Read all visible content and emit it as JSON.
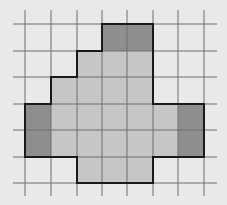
{
  "grid": {
    "x_lines": [
      25,
      51,
      77,
      102,
      127,
      153,
      178,
      204
    ],
    "y_lines": [
      24,
      51,
      77,
      104,
      130,
      157,
      183
    ],
    "h_line_extent": [
      13,
      217
    ],
    "v_line_extent": [
      10,
      196
    ],
    "line_color": "#6e6e6e",
    "background": "#e9e9e9"
  },
  "colors": {
    "light": "#c6c6c6",
    "dark": "#8e8e8e",
    "outline": "#1a1a1a"
  },
  "cells": [
    {
      "col": 3,
      "row": 0,
      "shade": "dark"
    },
    {
      "col": 4,
      "row": 0,
      "shade": "dark"
    },
    {
      "col": 2,
      "row": 1,
      "shade": "light"
    },
    {
      "col": 3,
      "row": 1,
      "shade": "light"
    },
    {
      "col": 4,
      "row": 1,
      "shade": "light"
    },
    {
      "col": 1,
      "row": 2,
      "shade": "light"
    },
    {
      "col": 2,
      "row": 2,
      "shade": "light"
    },
    {
      "col": 3,
      "row": 2,
      "shade": "light"
    },
    {
      "col": 4,
      "row": 2,
      "shade": "light"
    },
    {
      "col": 0,
      "row": 3,
      "shade": "dark"
    },
    {
      "col": 1,
      "row": 3,
      "shade": "light"
    },
    {
      "col": 2,
      "row": 3,
      "shade": "light"
    },
    {
      "col": 3,
      "row": 3,
      "shade": "light"
    },
    {
      "col": 4,
      "row": 3,
      "shade": "light"
    },
    {
      "col": 5,
      "row": 3,
      "shade": "light"
    },
    {
      "col": 6,
      "row": 3,
      "shade": "dark"
    },
    {
      "col": 0,
      "row": 4,
      "shade": "dark"
    },
    {
      "col": 1,
      "row": 4,
      "shade": "light"
    },
    {
      "col": 2,
      "row": 4,
      "shade": "light"
    },
    {
      "col": 3,
      "row": 4,
      "shade": "light"
    },
    {
      "col": 4,
      "row": 4,
      "shade": "light"
    },
    {
      "col": 5,
      "row": 4,
      "shade": "light"
    },
    {
      "col": 6,
      "row": 4,
      "shade": "dark"
    },
    {
      "col": 2,
      "row": 5,
      "shade": "light"
    },
    {
      "col": 3,
      "row": 5,
      "shade": "light"
    },
    {
      "col": 4,
      "row": 5,
      "shade": "light"
    }
  ]
}
